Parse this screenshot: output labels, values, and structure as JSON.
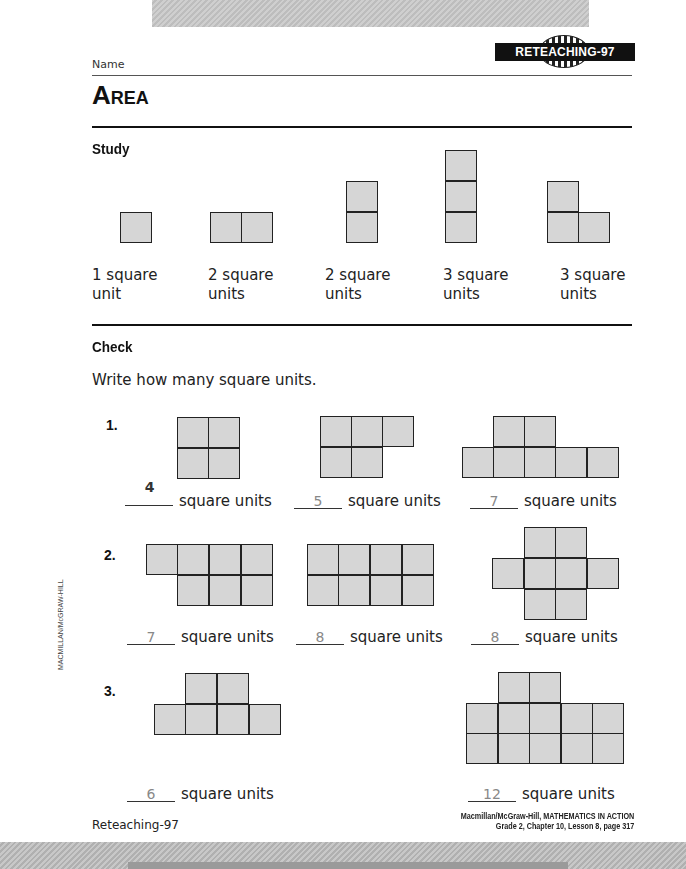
{
  "header": {
    "badge": "RETEACHING-97",
    "name_label": "Name",
    "title_first": "A",
    "title_rest": "REA"
  },
  "study": {
    "heading": "Study",
    "items": [
      {
        "label": "1 square unit",
        "squares": 1
      },
      {
        "label": "2 square units",
        "squares": 2
      },
      {
        "label": "2 square units",
        "squares": 2
      },
      {
        "label": "3 square units",
        "squares": 3
      },
      {
        "label": "3 square units",
        "squares": 3
      }
    ]
  },
  "check": {
    "heading": "Check",
    "instruction": "Write how many square units.",
    "unit_text": "square units",
    "rows": [
      {
        "number": "1.",
        "answers": [
          "4",
          "5",
          "7"
        ]
      },
      {
        "number": "2.",
        "answers": [
          "7",
          "8",
          "8"
        ]
      },
      {
        "number": "3.",
        "answers": [
          "6",
          "12"
        ]
      }
    ]
  },
  "footer": {
    "left": "Reteaching-97",
    "right_line1": "Macmillan/McGraw-Hill, MATHEMATICS IN ACTION",
    "right_line2": "Grade 2, Chapter 10, Lesson 8, page 317",
    "side_credit": "MACMILLAN/McGRAW-HILL"
  }
}
